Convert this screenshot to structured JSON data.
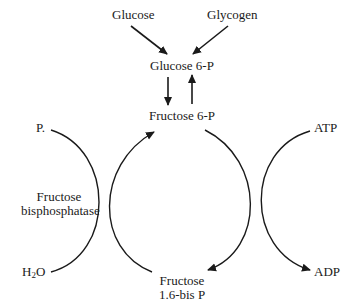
{
  "diagram": {
    "nodes": {
      "glucose": "Glucose",
      "glycogen": "Glycogen",
      "glucose6p": "Glucose 6-P",
      "fructose6p": "Fructose 6-P",
      "fructose16bisp_line1": "Fructose",
      "fructose16bisp_line2": "1.6-bis P",
      "pi": "P.",
      "h2o_main": "H",
      "h2o_sub": "2",
      "h2o_end": "O",
      "atp": "ATP",
      "adp": "ADP",
      "enzyme_line1": "Fructose",
      "enzyme_line2": "bisphosphatase"
    },
    "edges": [
      {
        "from": "Glucose",
        "to": "Glucose 6-P"
      },
      {
        "from": "Glycogen",
        "to": "Glucose 6-P"
      },
      {
        "from": "Glucose 6-P",
        "to": "Fructose 6-P"
      },
      {
        "from": "Fructose 6-P",
        "to": "Glucose 6-P"
      },
      {
        "from": "Fructose 6-P",
        "to": "Fructose 1.6-bis P",
        "cofactor_in": "ATP",
        "cofactor_out": "ADP"
      },
      {
        "from": "Fructose 1.6-bis P",
        "to": "Fructose 6-P",
        "enzyme": "Fructose bisphosphatase",
        "cofactor_in": "H2O",
        "cofactor_out": "P."
      }
    ],
    "line_color": "#1a1a1a"
  }
}
